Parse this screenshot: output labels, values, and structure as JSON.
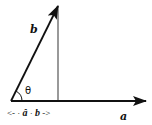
{
  "diagram": {
    "colors": {
      "stroke": "#111111",
      "background": "#ffffff",
      "projection_line": "#555555"
    },
    "vectors": [
      {
        "name": "a",
        "label": "a",
        "from": [
          11,
          101
        ],
        "to": [
          146,
          101
        ]
      },
      {
        "name": "b",
        "label": "b",
        "from": [
          11,
          101
        ],
        "to": [
          58,
          6
        ]
      }
    ],
    "perpendicular": {
      "from": [
        58,
        6
      ],
      "to": [
        58,
        101
      ]
    },
    "angle": {
      "label": "θ",
      "vertex": [
        11,
        101
      ]
    },
    "projection": {
      "left_arrow": "<-",
      "dot1": "·",
      "a_hat": "â",
      "dot2": "·",
      "b": "b",
      "right_arrow": "->"
    }
  }
}
